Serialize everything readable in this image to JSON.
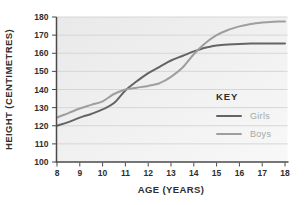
{
  "chart_data": {
    "type": "line",
    "title": "",
    "xlabel": "AGE (YEARS)",
    "ylabel": "HEIGHT (CENTIMETRES)",
    "xlim": [
      8,
      18
    ],
    "ylim": [
      100,
      180
    ],
    "x_ticks": [
      8,
      9,
      10,
      11,
      12,
      13,
      14,
      15,
      16,
      17,
      18
    ],
    "y_ticks": [
      100,
      110,
      120,
      130,
      140,
      150,
      160,
      170,
      180
    ],
    "grid": "horizontal-only",
    "legend": {
      "title": "KEY",
      "position": "inside-right",
      "entries": [
        "Girls",
        "Boys"
      ]
    },
    "x": [
      8,
      8.5,
      9,
      9.5,
      10,
      10.5,
      11,
      11.5,
      12,
      12.5,
      13,
      13.5,
      14,
      14.5,
      15,
      15.5,
      16,
      16.5,
      17,
      17.5,
      18
    ],
    "series": [
      {
        "name": "Girls",
        "color": "#646464",
        "values": [
          120,
          122,
          124.5,
          126.5,
          129,
          132.5,
          139.5,
          144.5,
          149,
          152.5,
          156,
          158.5,
          161,
          163,
          164.2,
          164.8,
          165.1,
          165.3,
          165.4,
          165.4,
          165.4
        ]
      },
      {
        "name": "Boys",
        "color": "#9e9e9e",
        "values": [
          124.5,
          127,
          129.5,
          131.5,
          133.5,
          137.5,
          140,
          141,
          142,
          143.5,
          147,
          152,
          159.5,
          165.5,
          170,
          172.8,
          174.8,
          176.2,
          177,
          177.4,
          177.5
        ]
      }
    ],
    "styles": {
      "plot_bg_left": "#e9e9e9",
      "plot_bg_right": "#f8f8f8",
      "gridline": "#d6d6d6",
      "axis": "#4a4a4a",
      "tick_text": "#2e2e2e",
      "legend_title_color": "#2e2e2e",
      "legend_label_color": "#a6a6a6"
    }
  }
}
